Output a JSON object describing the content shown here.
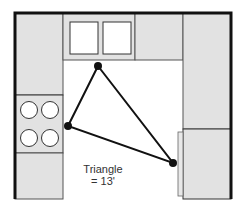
{
  "diagram": {
    "type": "kitchen-floor-plan",
    "layout": "U-shaped",
    "label_line1": "Triangle",
    "label_line2": "= 13'",
    "colors": {
      "counter": "#e2e2e2",
      "wall": "#111111",
      "outline": "#555555",
      "triangle": "#111111",
      "background": "#ffffff"
    },
    "elements": {
      "left_counter_upper": "counter",
      "range": "range with 4 burners",
      "left_counter_lower": "counter",
      "sink": "double-bowl sink",
      "top_counter": "counter",
      "right_counter": "counter",
      "refrigerator": "refrigerator"
    },
    "work_triangle": {
      "points": [
        {
          "name": "sink",
          "x": 98,
          "y": 66
        },
        {
          "name": "range",
          "x": 68,
          "y": 126
        },
        {
          "name": "refrigerator",
          "x": 173,
          "y": 163
        }
      ],
      "total_length": "13'"
    }
  }
}
